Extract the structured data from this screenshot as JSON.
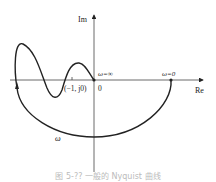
{
  "diagram": {
    "type": "nyquist-plot",
    "axes": {
      "imag_label": "Im",
      "real_label": "Re",
      "origin_label": "0"
    },
    "points": {
      "critical_point": "(−1, j0)",
      "omega_infinity": "ω=∞",
      "omega_zero": "ω=0"
    },
    "curve_label": "ω",
    "colors": {
      "stroke": "#222222",
      "background": "#ffffff"
    }
  },
  "caption": "图 5-?? 一般的 Nyquist 曲线"
}
